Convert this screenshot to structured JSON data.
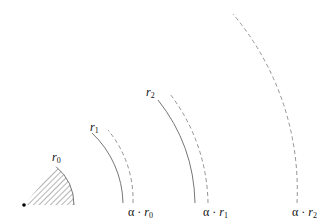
{
  "diagram": {
    "origin": {
      "x": 24,
      "y": 205
    },
    "sector": {
      "label_var": "r",
      "label_sub": "0",
      "radius": 50,
      "hatched": true
    },
    "solid_arcs": [
      {
        "label_var": "r",
        "label_sub": "1",
        "radius": 99
      },
      {
        "label_var": "r",
        "label_sub": "2",
        "radius": 171
      }
    ],
    "dashed_arcs": [
      {
        "label_prefix": "α · ",
        "label_var": "r",
        "label_sub": "0",
        "radius": 109
      },
      {
        "label_prefix": "α · ",
        "label_var": "r",
        "label_sub": "1",
        "radius": 184
      },
      {
        "label_prefix": "α · ",
        "label_var": "r",
        "label_sub": "2",
        "radius": 273
      }
    ],
    "colors": {
      "line": "#666666",
      "dashed": "#888888",
      "hatch": "#777777",
      "dot": "#000000"
    }
  }
}
